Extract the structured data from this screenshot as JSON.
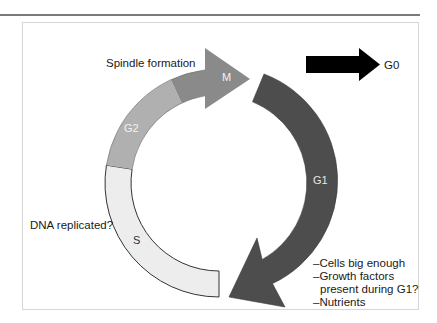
{
  "diagram": {
    "phases": [
      {
        "id": "S",
        "label": "S",
        "color": "#ededed",
        "text_color": "#333333"
      },
      {
        "id": "G2",
        "label": "G2",
        "color": "#b0b0b0",
        "text_color": "#f2f2f2"
      },
      {
        "id": "M",
        "label": "M",
        "color": "#8a8a8a",
        "text_color": "#f2f2f2"
      },
      {
        "id": "G1",
        "label": "G1",
        "color": "#4d4d4d",
        "text_color": "#e6e6e6"
      }
    ],
    "exit_arrow": {
      "label": "G0",
      "color": "#000000"
    },
    "annotations": {
      "spindle": "Spindle formation",
      "dna": "DNA replicated?",
      "g1_checks": [
        "–Cells big enough",
        "–Growth factors",
        "  present during G1?",
        "–Nutrients"
      ]
    },
    "outline_color": "#333333",
    "frame_color": "#d6d6d6"
  }
}
